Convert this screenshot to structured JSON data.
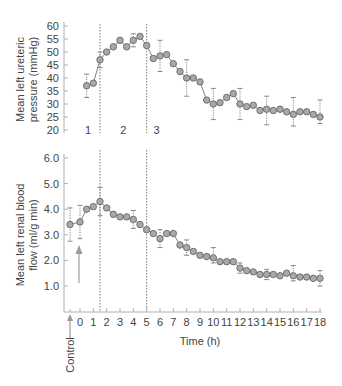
{
  "chart_data": [
    {
      "type": "line",
      "ylabel": "Mean left ureteric pressure (mmHg)",
      "ylabel_lines": [
        "Mean left ureteric",
        "pressure (mmHg)"
      ],
      "ylim": [
        20,
        60
      ],
      "yticks": [
        20,
        25,
        30,
        35,
        40,
        45,
        50,
        55,
        60
      ],
      "phase_labels": [
        {
          "label": "1",
          "x": 0.75
        },
        {
          "label": "2",
          "x": 3.25
        },
        {
          "label": "3",
          "x": 5.75
        }
      ],
      "vlines": [
        1.5,
        5
      ],
      "x": [
        0.5,
        1,
        1.5,
        2,
        2.5,
        3,
        3.5,
        4,
        4.5,
        5,
        5.5,
        6,
        6.5,
        7,
        7.5,
        8,
        8.5,
        9,
        9.5,
        10,
        10.5,
        11,
        11.5,
        12,
        12.5,
        13,
        13.5,
        14,
        14.5,
        15,
        15.5,
        16,
        16.5,
        17,
        17.5,
        18
      ],
      "values": [
        37,
        38,
        47,
        50,
        52,
        54.5,
        52,
        54.5,
        56,
        52.5,
        47.5,
        48.5,
        49,
        45.5,
        42.5,
        40,
        40,
        38.5,
        31.5,
        30,
        30.5,
        32.5,
        34,
        30,
        29,
        29.5,
        27.5,
        28,
        27.5,
        28,
        27,
        26,
        27,
        27,
        26,
        25,
        27
      ],
      "error_bars": [
        {
          "x": 0.5,
          "y": 37,
          "err": 4.5
        },
        {
          "x": 1.5,
          "y": 47,
          "err": 3
        },
        {
          "x": 4,
          "y": 54.5,
          "err": 2.5
        },
        {
          "x": 6,
          "y": 48.5,
          "err": 6
        },
        {
          "x": 8,
          "y": 40,
          "err": 7
        },
        {
          "x": 10,
          "y": 30,
          "err": 6
        },
        {
          "x": 12,
          "y": 30,
          "err": 6
        },
        {
          "x": 14,
          "y": 27.5,
          "err": 5.5
        },
        {
          "x": 16,
          "y": 27,
          "err": 5.5
        },
        {
          "x": 18,
          "y": 27,
          "err": 4.5
        }
      ]
    },
    {
      "type": "line",
      "ylabel": "Mean left renal blood flow (ml/g min)",
      "ylabel_lines": [
        "Mean left renal blood",
        "flow (ml/g min)"
      ],
      "xlabel": "Time (h)",
      "ylim": [
        0,
        6.0
      ],
      "yticks": [
        "1.0",
        "2.0",
        "3.0",
        "4.0",
        "5.0",
        "6.0"
      ],
      "xticks": [
        0,
        1,
        2,
        3,
        4,
        5,
        6,
        7,
        8,
        9,
        10,
        11,
        12,
        13,
        14,
        15,
        16,
        17,
        18
      ],
      "vlines": [
        1.5,
        5
      ],
      "control_label": "Control",
      "x": [
        -0.75,
        0,
        0.5,
        1,
        1.5,
        2,
        2.5,
        3,
        3.5,
        4,
        4.5,
        5,
        5.5,
        6,
        6.5,
        7,
        7.5,
        8,
        8.5,
        9,
        9.5,
        10,
        10.5,
        11,
        11.5,
        12,
        12.5,
        13,
        13.5,
        14,
        14.5,
        15,
        15.5,
        16,
        16.5,
        17,
        17.5,
        18
      ],
      "values": [
        3.4,
        3.5,
        4.0,
        4.1,
        4.3,
        4.05,
        3.8,
        3.7,
        3.7,
        3.6,
        3.4,
        3.2,
        3.05,
        2.85,
        3.05,
        3.05,
        2.6,
        2.5,
        2.35,
        2.2,
        2.15,
        2.1,
        1.95,
        1.95,
        1.95,
        1.7,
        1.6,
        1.55,
        1.45,
        1.45,
        1.45,
        1.4,
        1.5,
        1.4,
        1.35,
        1.35,
        1.3,
        1.3
      ],
      "error_bars": [
        {
          "x": -0.75,
          "y": 3.4,
          "err": 0.65
        },
        {
          "x": 0,
          "y": 3.5,
          "err": 0.65
        },
        {
          "x": 1.5,
          "y": 4.3,
          "err": 0.55
        },
        {
          "x": 4,
          "y": 3.6,
          "err": 0.35
        },
        {
          "x": 6,
          "y": 2.85,
          "err": 0.35
        },
        {
          "x": 8,
          "y": 2.5,
          "err": 0.3
        },
        {
          "x": 10,
          "y": 2.2,
          "err": 0.3
        },
        {
          "x": 12,
          "y": 1.7,
          "err": 0.2
        },
        {
          "x": 14,
          "y": 1.45,
          "err": 0.2
        },
        {
          "x": 16,
          "y": 1.5,
          "err": 0.3
        },
        {
          "x": 18,
          "y": 1.3,
          "err": 0.3
        }
      ]
    }
  ],
  "colors": {
    "marker_fill": "#a9a9a9",
    "marker_stroke": "#6e6e6e",
    "line": "#808080",
    "axis": "#b0b0b0",
    "arrow": "#9a9a9a",
    "text": "#444444"
  }
}
